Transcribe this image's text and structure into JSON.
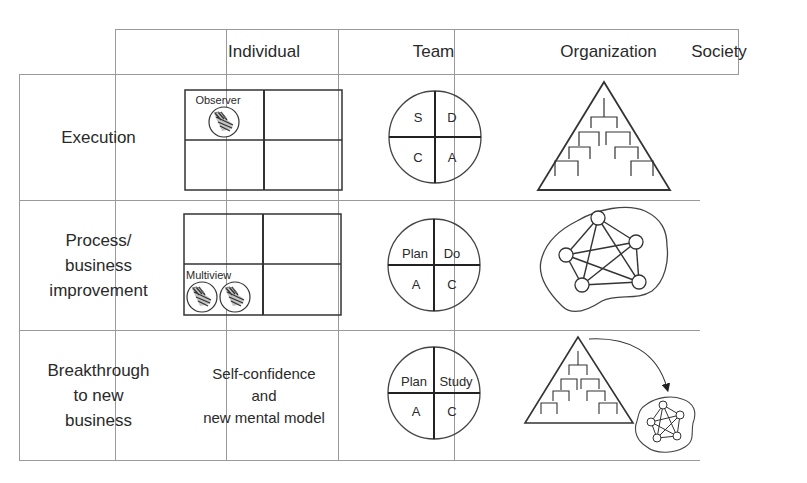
{
  "columns": [
    {
      "label": "Individual"
    },
    {
      "label": "Team"
    },
    {
      "label": "Organization"
    },
    {
      "label": "Society"
    }
  ],
  "rows": [
    {
      "label_lines": [
        "Execution"
      ],
      "individual": {
        "type": "quadrant-grid",
        "caption": "Observer",
        "observer_icons": 1
      },
      "team": {
        "type": "cycle",
        "quadrants": [
          "S",
          "D",
          "C",
          "A"
        ]
      },
      "organization": {
        "type": "hierarchy-pyramid"
      }
    },
    {
      "label_lines": [
        "Process/",
        "business",
        "improvement"
      ],
      "individual": {
        "type": "quadrant-grid",
        "caption": "Multiview",
        "observer_icons": 2
      },
      "team": {
        "type": "cycle",
        "quadrants": [
          "Plan",
          "Do",
          "A",
          "C"
        ]
      },
      "organization": {
        "type": "network-blob"
      }
    },
    {
      "label_lines": [
        "Breakthrough",
        "to new",
        "business"
      ],
      "individual": {
        "type": "text",
        "lines": [
          "Self-confidence",
          "and",
          "new mental model"
        ]
      },
      "team": {
        "type": "cycle",
        "quadrants": [
          "Plan",
          "Study",
          "A",
          "C"
        ]
      },
      "organization": {
        "type": "pyramid-to-network"
      }
    }
  ]
}
